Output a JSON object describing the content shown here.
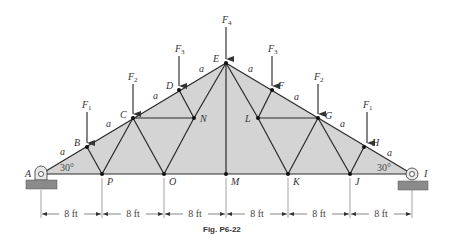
{
  "figure": {
    "caption": "Fig. P6-22",
    "fill_color": "#d4d4d4",
    "member_color": "#2a2a2a",
    "support_color": "#8a8a8a"
  },
  "joints": {
    "A": "A",
    "B": "B",
    "C": "C",
    "D": "D",
    "E": "E",
    "F": "F",
    "G": "G",
    "H": "H",
    "I": "I",
    "J": "J",
    "K": "K",
    "L": "L",
    "M": "M",
    "N": "N",
    "O": "O",
    "P": "P"
  },
  "loads": {
    "F1": {
      "base": "F",
      "sub": "1"
    },
    "F2": {
      "base": "F",
      "sub": "2"
    },
    "F3": {
      "base": "F",
      "sub": "3"
    },
    "F4": {
      "base": "F",
      "sub": "4"
    }
  },
  "segment_label": "a",
  "angle_label": "30°",
  "dimensions": [
    "8 ft",
    "8 ft",
    "8 ft",
    "8 ft",
    "8 ft",
    "8 ft"
  ]
}
